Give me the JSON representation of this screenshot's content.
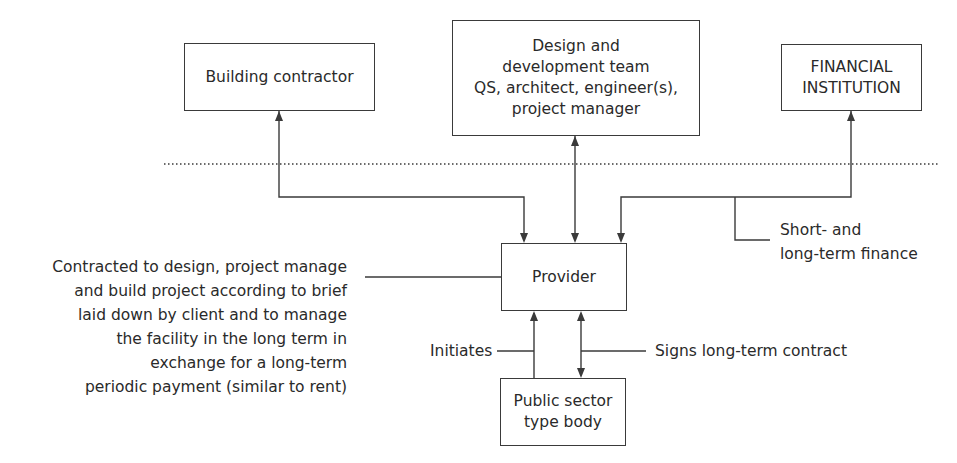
{
  "boxes": {
    "building_contractor": {
      "lines": [
        "Building contractor"
      ]
    },
    "design_team": {
      "lines": [
        "Design and",
        "development team",
        "QS, architect, engineer(s),",
        "project manager"
      ]
    },
    "financial_institution": {
      "lines": [
        "FINANCIAL",
        "INSTITUTION"
      ]
    },
    "provider": {
      "lines": [
        "Provider"
      ]
    },
    "public_sector": {
      "lines": [
        "Public sector",
        "type body"
      ]
    }
  },
  "annotations": {
    "provider_role": {
      "lines": [
        "Contracted to design, project manage",
        "and build project according to brief",
        "laid down by client and to manage",
        "the facility in the long term in",
        "exchange for a long-term",
        "periodic payment (similar to rent)"
      ]
    },
    "finance": {
      "lines": [
        "Short- and",
        "long-term finance"
      ]
    },
    "initiates": "Initiates",
    "signs_contract": "Signs long-term contract"
  },
  "colors": {
    "line": "#3a3a3a",
    "text": "#2a2a2a",
    "background": "#ffffff"
  }
}
